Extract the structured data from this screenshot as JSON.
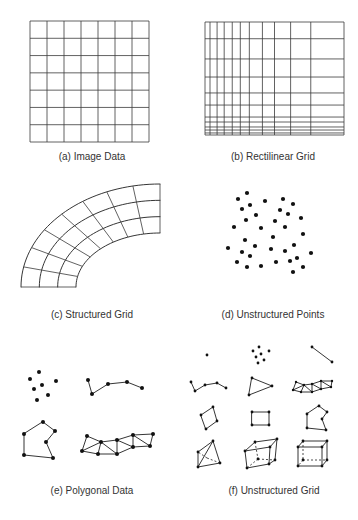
{
  "figure": {
    "panels": [
      {
        "id": "a",
        "label": "(a) Image Data",
        "kind": "uniform-grid",
        "columns": 7,
        "rows": 7
      },
      {
        "id": "b",
        "label": "(b) Rectilinear Grid",
        "kind": "rectilinear-grid",
        "x_lines": [
          0,
          0.036,
          0.087,
          0.138,
          0.196,
          0.254,
          0.319,
          0.413,
          0.5,
          0.616,
          0.761,
          1.0
        ],
        "y_lines": [
          0,
          0.148,
          0.327,
          0.487,
          0.628,
          0.735,
          0.841,
          0.885,
          0.929,
          0.956,
          0.982,
          1.0
        ]
      },
      {
        "id": "c",
        "label": "(c) Structured Grid",
        "kind": "curvilinear-grid",
        "radial_cells": 3,
        "angular_cells": 8
      },
      {
        "id": "d",
        "label": "(d) Unstructured Points",
        "kind": "points",
        "point_count": 35
      },
      {
        "id": "e",
        "label": "(e) Polygonal Data",
        "kind": "polydata",
        "items": [
          "vertices",
          "polyline",
          "polygon",
          "triangle-strip"
        ]
      },
      {
        "id": "f",
        "label": "(f) Unstructured Grid",
        "kind": "unstructured-grid",
        "cell_types": [
          "vertex",
          "poly-vertex",
          "line",
          "polyline",
          "triangle",
          "triangle-strip",
          "quad",
          "pixel",
          "polygon",
          "tetra",
          "wedge",
          "hexahedron"
        ]
      }
    ]
  }
}
